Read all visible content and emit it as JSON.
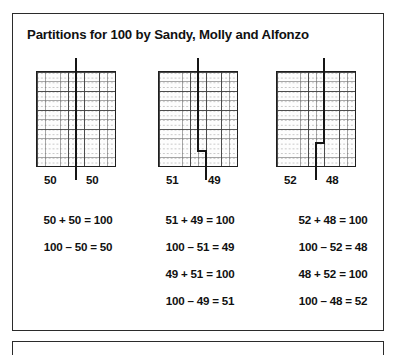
{
  "page": {
    "title": "Partitions for 100 by Sandy, Molly and Alfonzo",
    "ink_color": "#151515",
    "border_color": "#2b2b2b"
  },
  "partitions": [
    {
      "name": "partition-50-50",
      "left_label": "50",
      "right_label": "50",
      "left_value": 50,
      "right_value": 50,
      "total": 100,
      "divider_shape": "straight",
      "equations": [
        "50 + 50 = 100",
        "100 – 50 = 50"
      ]
    },
    {
      "name": "partition-51-49",
      "left_label": "51",
      "right_label": "49",
      "left_value": 51,
      "right_value": 49,
      "total": 100,
      "divider_shape": "step-right-near-bottom",
      "equations": [
        "51 + 49 = 100",
        "100 – 51 = 49",
        "49 + 51 = 100",
        "100 – 49 = 51"
      ]
    },
    {
      "name": "partition-52-48",
      "left_label": "52",
      "right_label": "48",
      "left_value": 52,
      "right_value": 48,
      "total": 100,
      "divider_shape": "step-left-near-bottom",
      "equations": [
        "52 + 48 = 100",
        "100 – 52 = 48",
        "48 + 52 = 100",
        "100 – 48 = 52"
      ]
    }
  ]
}
